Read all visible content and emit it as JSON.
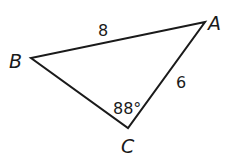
{
  "figure": {
    "type": "triangle",
    "vertices": [
      {
        "label": "A",
        "x": 205,
        "y": 22
      },
      {
        "label": "B",
        "x": 31,
        "y": 58
      },
      {
        "label": "C",
        "x": 128,
        "y": 128
      }
    ],
    "sides": {
      "AB": {
        "label": "8"
      },
      "AC": {
        "label": "6"
      }
    },
    "angles": {
      "C": {
        "label": "88°"
      }
    },
    "stroke_color": "#1a1a1a"
  }
}
